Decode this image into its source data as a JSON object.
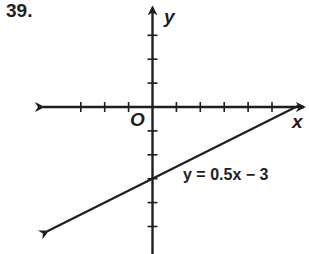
{
  "problem": {
    "number": "39."
  },
  "chart_data": {
    "type": "line",
    "title": "",
    "xlabel": "x",
    "ylabel": "y",
    "origin_label": "O",
    "xlim": [
      -4,
      6
    ],
    "ylim": [
      -6,
      4
    ],
    "grid": false,
    "x_ticks": [
      -4,
      -3,
      -2,
      -1,
      1,
      2,
      3,
      4,
      5,
      6
    ],
    "y_ticks": [
      -6,
      -5,
      -4,
      -3,
      -2,
      -1,
      1,
      2,
      3,
      4
    ],
    "series": [
      {
        "name": "y = 0.5x − 3",
        "equation": "y = 0.5x − 3",
        "slope": 0.5,
        "intercept": -3,
        "x": [
          -4.4,
          6.1
        ],
        "y": [
          -5.2,
          0.05
        ]
      }
    ],
    "annotations": [
      {
        "text": "y = 0.5x − 3",
        "x": 1.3,
        "y": -2.9
      }
    ]
  }
}
